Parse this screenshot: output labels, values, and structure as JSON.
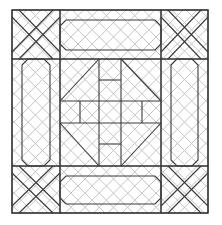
{
  "diagram": {
    "type": "quilt-block-pattern",
    "layout": "3x3 nine-patch with corner X blocks, side bar panels, and central star-cross square",
    "background_quilting": "diagonal crosshatch",
    "colors": {
      "background": "#ffffff",
      "seam_line": "#3a3a3a",
      "quilting_line": "#c4c4c4"
    },
    "sections": [
      {
        "name": "corner-top-left",
        "motif": "crossed diagonal strips (X)"
      },
      {
        "name": "panel-top",
        "motif": "elongated octagon bar"
      },
      {
        "name": "corner-top-right",
        "motif": "crossed diagonal strips (X)"
      },
      {
        "name": "panel-left",
        "motif": "elongated octagon bar"
      },
      {
        "name": "center-square",
        "motif": "square-in-square with central cross"
      },
      {
        "name": "panel-right",
        "motif": "elongated octagon bar"
      },
      {
        "name": "corner-bottom-left",
        "motif": "crossed diagonal strips (X)"
      },
      {
        "name": "panel-bottom",
        "motif": "elongated octagon bar"
      },
      {
        "name": "corner-bottom-right",
        "motif": "crossed diagonal strips (X)"
      }
    ]
  }
}
